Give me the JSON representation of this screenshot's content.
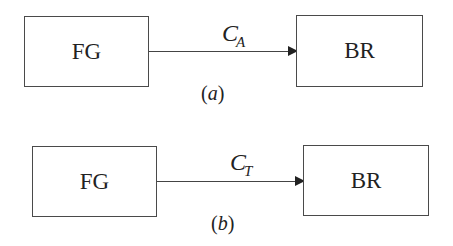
{
  "diagrams": [
    {
      "id": "a",
      "source": {
        "label": "FG"
      },
      "target": {
        "label": "BR"
      },
      "edge": {
        "symbol": "C",
        "subscript": "A"
      },
      "caption_open": "(",
      "caption_letter": "a",
      "caption_close": ")"
    },
    {
      "id": "b",
      "source": {
        "label": "FG"
      },
      "target": {
        "label": "BR"
      },
      "edge": {
        "symbol": "C",
        "subscript": "T"
      },
      "caption_open": "(",
      "caption_letter": "b",
      "caption_close": ")"
    }
  ],
  "colors": {
    "stroke": "#4a4a4a",
    "text": "#222222",
    "background": "#ffffff"
  }
}
